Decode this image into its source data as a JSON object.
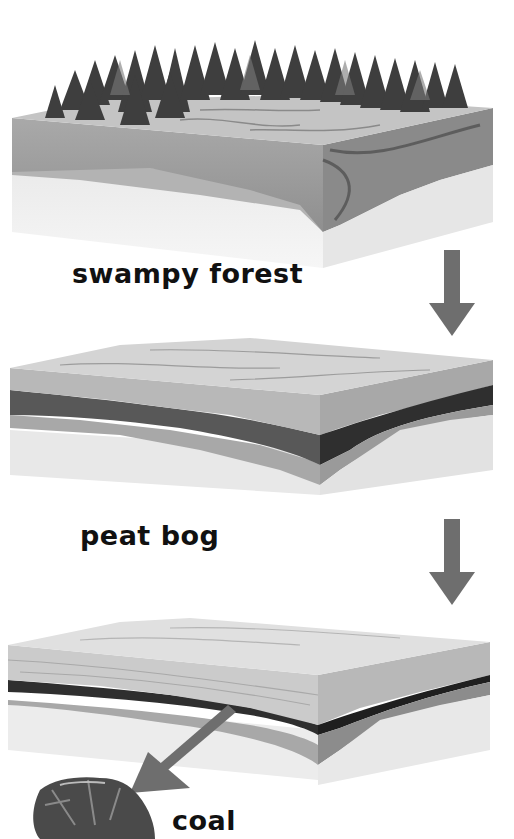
{
  "diagram": {
    "stages": [
      {
        "id": "swampy-forest",
        "label": "swampy forest"
      },
      {
        "id": "peat-bog",
        "label": "peat bog"
      },
      {
        "id": "coal-seam",
        "label": "coal"
      }
    ],
    "colors": {
      "background": "#ffffff",
      "arrow": "#6e6e6e",
      "label_text": "#111111",
      "topsoil": "#b9b9b9",
      "dark_layer": "#4a4a4a",
      "mid_layer": "#9c9c9c",
      "base_layer": "#e3e3e3"
    },
    "icons": {
      "stage_arrow": "arrow-down",
      "coal_pointer": "arrow-down-left",
      "coal_lump": "coal-lump"
    }
  }
}
